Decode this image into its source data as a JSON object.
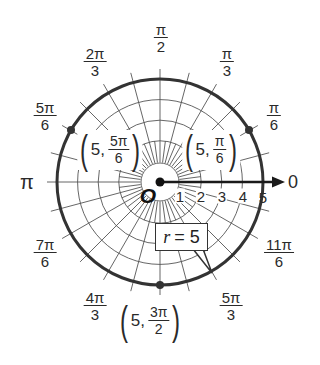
{
  "diagram": {
    "type": "polar-coordinate-grid",
    "center": {
      "x": 160,
      "y": 182
    },
    "unit_radius_px": 20.6,
    "max_radius": 5,
    "colors": {
      "grid": "#555555",
      "circle": "#333333",
      "axis": "#1a1a1a",
      "background": "#ffffff"
    },
    "origin_label": "O",
    "polar_axis_label": "0",
    "pi_label": "π",
    "radial_ticks": [
      "1",
      "2",
      "3",
      "4",
      "5"
    ],
    "angle_labels": [
      {
        "name": "pi-over-2",
        "num": "π",
        "den": "2"
      },
      {
        "name": "pi-over-3",
        "num": "π",
        "den": "3"
      },
      {
        "name": "2pi-over-3",
        "num": "2π",
        "den": "3"
      },
      {
        "name": "pi-over-6",
        "num": "π",
        "den": "6"
      },
      {
        "name": "5pi-over-6",
        "num": "5π",
        "den": "6"
      },
      {
        "name": "7pi-over-6",
        "num": "7π",
        "den": "6"
      },
      {
        "name": "11pi-over-6",
        "num": "11π",
        "den": "6"
      },
      {
        "name": "4pi-over-3",
        "num": "4π",
        "den": "3"
      },
      {
        "name": "5pi-over-3",
        "num": "5π",
        "den": "3"
      }
    ],
    "points": [
      {
        "r": "5",
        "theta_num": "5π",
        "theta_den": "6",
        "open": "(",
        "close": ")",
        "sep": ","
      },
      {
        "r": "5",
        "theta_num": "π",
        "theta_den": "6",
        "open": "(",
        "close": ")",
        "sep": ","
      },
      {
        "r": "5",
        "theta_num": "3π",
        "theta_den": "2",
        "open": "(",
        "close": ")",
        "sep": ","
      }
    ],
    "callout": {
      "var": "r",
      "eq": "= 5"
    }
  }
}
